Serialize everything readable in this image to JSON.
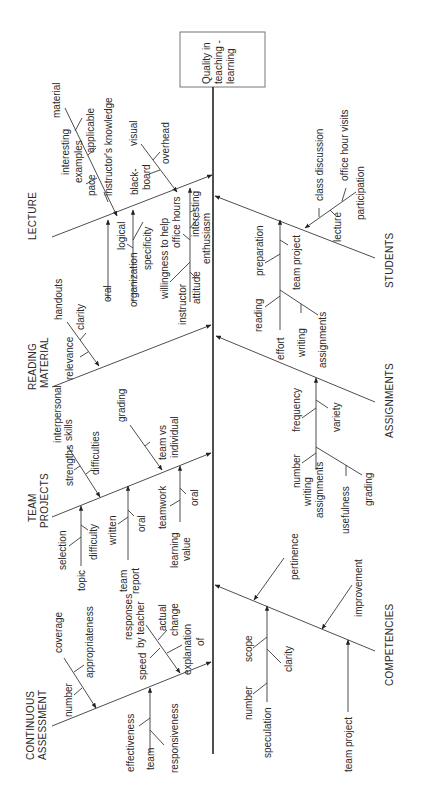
{
  "diagram": {
    "type": "fishbone",
    "orientation": "rotated-90-ccw",
    "effect": "Quality in teaching - learning",
    "effect_lines": [
      "Quality in",
      "teaching -",
      "learning"
    ],
    "categories": {
      "lecture": {
        "title": "LECTURE",
        "causes": {
          "material": "material",
          "interesting": "interesting",
          "examples": "examples",
          "applicable": "applicable",
          "pace": "pace",
          "instructors_knowledge": "instructor's knowledge",
          "visual": "visual",
          "black": "black-",
          "board": "board",
          "overhead": "overhead",
          "oral": "oral",
          "logical": "logical",
          "organization": "organization",
          "specificity": "specificity",
          "willingness": "willingness to help",
          "office_hours": "office hours",
          "interesting2": "interesting",
          "instructor": "instructor",
          "attitude": "attitude",
          "enthusiasm": "enthusiasm"
        }
      },
      "reading_material": {
        "title_lines": [
          "READING",
          "MATERIAL"
        ],
        "causes": {
          "handouts": "handouts",
          "clarity": "clarity",
          "relevance": "relevance"
        }
      },
      "team_projects": {
        "title_lines": [
          "TEAM",
          "PROJECTS"
        ],
        "causes": {
          "interpersonal": "interpersonal",
          "skills": "skills",
          "strengths": "strengths",
          "difficulties": "difficulties",
          "grading": "grading",
          "team_vs": "team vs",
          "individual": "individual",
          "selection": "selection",
          "topic": "topic",
          "difficulty": "difficulty",
          "written": "written",
          "team": "team",
          "report": "report",
          "oral": "oral",
          "teamwork": "teamwork",
          "learning": "learning",
          "value": "value",
          "oral2": "oral"
        }
      },
      "continuous_assessment": {
        "title_lines": [
          "CONTINUOUS",
          "ASSESSMENT"
        ],
        "causes": {
          "coverage": "coverage",
          "number": "number",
          "appropriateness": "appropriateness",
          "responses": "responses",
          "by_teacher": "by teacher",
          "actual": "actual",
          "change": "change",
          "speed": "speed",
          "explanation": "explanation",
          "of": "of",
          "effectiveness": "effectiveness",
          "team": "team",
          "responsiveness": "responsiveness"
        }
      },
      "students": {
        "title": "STUDENTS",
        "causes": {
          "class_discussion": "class discussion",
          "office_hour_visits": "office hour visits",
          "participation": "participation",
          "lecture": "lecture",
          "preparation": "preparation",
          "team_project": "team project",
          "reading": "reading",
          "effort": "effort",
          "writing": "writing",
          "assignments": "assignments"
        }
      },
      "assignments": {
        "title": "ASSIGNMENTS",
        "causes": {
          "number": "number",
          "frequency": "frequency",
          "variety": "variety",
          "writing": "writing",
          "assignments": "assignments",
          "usefulness": "usefulness",
          "grading": "grading"
        }
      },
      "competencies": {
        "title": "COMPETENCIES",
        "causes": {
          "pertinence": "pertinence",
          "improvement": "improvement",
          "scope": "scope",
          "number": "number",
          "clarity": "clarity",
          "speculation": "speculation",
          "team_project": "team project"
        }
      }
    }
  }
}
